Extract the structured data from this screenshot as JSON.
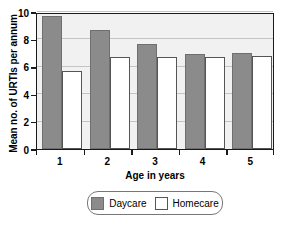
{
  "chart_data": {
    "type": "bar",
    "title": "",
    "xlabel": "Age in years",
    "ylabel": "Mean no. of URTIs per annum",
    "categories": [
      "1",
      "2",
      "3",
      "4",
      "5"
    ],
    "series": [
      {
        "name": "Daycare",
        "color": "#8b8b8b",
        "values": [
          9.7,
          8.7,
          7.7,
          6.9,
          7.0
        ]
      },
      {
        "name": "Homecare",
        "color": "#ffffff",
        "values": [
          5.7,
          6.7,
          6.7,
          6.7,
          6.8
        ]
      }
    ],
    "ylim": [
      0,
      10
    ],
    "yticks": [
      0,
      2,
      4,
      6,
      8,
      10
    ],
    "ytick_labels": [
      "0",
      "2",
      "4",
      "6",
      "8",
      "10"
    ],
    "grid": true,
    "legend_position": "bottom-center",
    "plot_background": "#f1f1f1",
    "gridline_color": "#c4c4c4",
    "axis_color": "#1a1a1a"
  },
  "legend": {
    "entries": [
      {
        "label": "Daycare"
      },
      {
        "label": "Homecare"
      }
    ]
  }
}
